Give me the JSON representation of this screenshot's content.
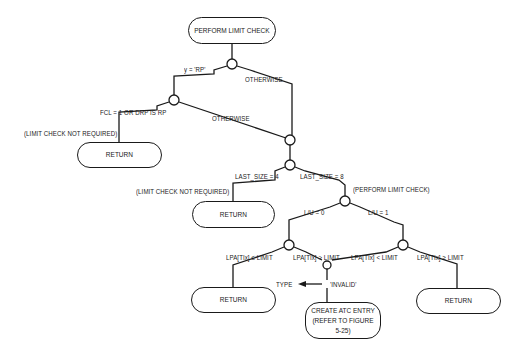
{
  "diagram": {
    "type": "flowchart",
    "start": {
      "label": "PERFORM LIMIT CHECK"
    },
    "branches": {
      "y_rp": "y = 'RP'",
      "otherwise_1": "OTHERWISE",
      "fcl": "FCL = 1 OR DRP IS RP",
      "otherwise_2": "OTHERWISE",
      "limit_not_required_1": "(LIMIT CHECK NOT REQUIRED)",
      "last_size_4": "LAST_SIZE = 4",
      "last_size_8": "LAST_SIZE = 8",
      "limit_not_required_2": "(LIMIT CHECK NOT REQUIRED)",
      "perform_limit_check_note": "(PERFORM LIMIT CHECK)",
      "lu_0": "L/U = 0",
      "lu_1": "L/U = 1",
      "lpa_le": "LPA[TIx] ≤ LIMIT",
      "lpa_gt": "LPA[TIx] > LIMIT",
      "lpa_lt": "LPA[TIx] < LIMIT",
      "lpa_ge": "LPA[TIx] ≥ LIMIT",
      "type_assign_target": "TYPE",
      "type_assign_value": "'INVALID'"
    },
    "terminals": {
      "return_1": "RETURN",
      "return_2": "RETURN",
      "return_3": "RETURN",
      "return_4": "RETURN",
      "create_atc_line1": "CREATE ATC ENTRY",
      "create_atc_line2": "(REFER TO FIGURE 5-25)"
    }
  }
}
